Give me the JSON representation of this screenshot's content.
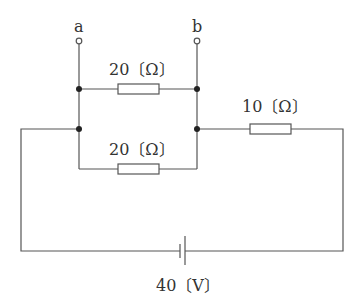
{
  "diagram": {
    "type": "circuit",
    "terminals": [
      {
        "id": "a",
        "label": "a"
      },
      {
        "id": "b",
        "label": "b"
      }
    ],
    "components": {
      "r_top": {
        "label": "20〔Ω〕",
        "resistance_ohm": 20
      },
      "r_bottom": {
        "label": "20〔Ω〕",
        "resistance_ohm": 20
      },
      "r_series": {
        "label": "10〔Ω〕",
        "resistance_ohm": 10
      },
      "battery": {
        "label": "40〔V〕",
        "voltage_v": 40
      }
    },
    "colors": {
      "wire": "#555555",
      "junction": "#222222",
      "text": "#333333"
    }
  }
}
